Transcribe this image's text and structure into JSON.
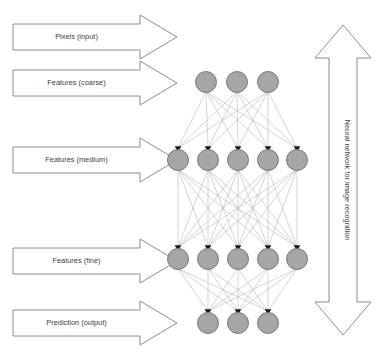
{
  "diagram": {
    "background_color": "#ffffff",
    "stage_arrows": [
      {
        "label": "Pixels (input)",
        "direction": "right",
        "y_center": 37
      },
      {
        "label": "Features (coarse)",
        "direction": "right",
        "y_center": 83
      },
      {
        "label": "Features (medium)",
        "direction": "right",
        "y_center": 160
      },
      {
        "label": "Features (fine)",
        "direction": "right",
        "y_center": 261
      },
      {
        "label": "Prediction (output)",
        "direction": "right",
        "y_center": 323
      }
    ],
    "side_arrow": {
      "label": "Neural network for image recognition",
      "direction": "double-vertical",
      "orientation": "vertical"
    },
    "network": {
      "layers": [
        {
          "name": "coarse-features-layer",
          "node_count": 3,
          "y": 82,
          "x_positions": [
            206,
            237,
            268
          ]
        },
        {
          "name": "medium-features-layer",
          "node_count": 5,
          "y": 160,
          "x_positions": [
            178,
            208,
            238,
            268,
            297
          ]
        },
        {
          "name": "fine-features-layer",
          "node_count": 5,
          "y": 259,
          "x_positions": [
            178,
            208,
            238,
            268,
            297
          ]
        },
        {
          "name": "output-layer",
          "node_count": 3,
          "y": 323,
          "x_positions": [
            208,
            238,
            268
          ]
        }
      ],
      "node_radius": 10.5,
      "node_fill": "#a6a6a6",
      "node_stroke": "#6e6e6e",
      "connection_color": "#b0b0b0",
      "arrowhead_color": "#1a1a1a",
      "fully_connected": true
    },
    "colors": {
      "outline": "#808080",
      "text": "#404040",
      "node_fill": "#a6a6a6",
      "node_stroke": "#6e6e6e",
      "connection": "#b0b0b0"
    }
  }
}
